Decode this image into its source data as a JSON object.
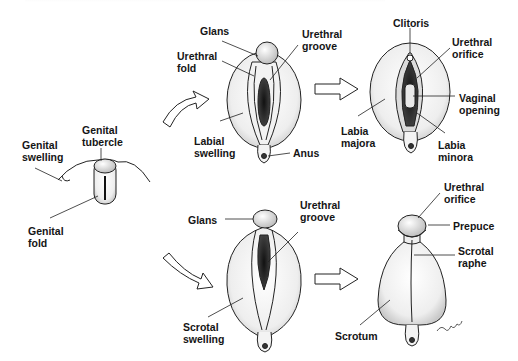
{
  "figure": {
    "stages": {
      "indifferent": {
        "labels": [
          "Genital swelling",
          "Genital tubercle",
          "Genital fold"
        ]
      },
      "female_intermediate": {
        "labels": [
          "Glans",
          "Urethral fold",
          "Urethral groove",
          "Labial swelling",
          "Anus"
        ]
      },
      "female_final": {
        "labels": [
          "Clitoris",
          "Urethral orifice",
          "Vaginal opening",
          "Labia majora",
          "Labia minora"
        ]
      },
      "male_intermediate": {
        "labels": [
          "Glans",
          "Urethral groove",
          "Scrotal swelling"
        ]
      },
      "male_final": {
        "labels": [
          "Urethral orifice",
          "Prepuce",
          "Scrotal raphe",
          "Scrotum"
        ]
      }
    },
    "arrows": [
      "curved-up-right",
      "curved-down-right",
      "straight-right-top",
      "straight-right-bottom"
    ],
    "colors": {
      "ink": "#151515",
      "shade": "#6b6b6b",
      "background": "#ffffff"
    }
  },
  "labels": {
    "genital_swelling": "Genital\nswelling",
    "genital_tubercle": "Genital\ntubercle",
    "genital_fold": "Genital\nfold",
    "f_glans": "Glans",
    "f_urethral_fold": "Urethral\nfold",
    "f_urethral_groove": "Urethral\ngroove",
    "f_labial_swelling": "Labial\nswelling",
    "f_anus": "Anus",
    "clitoris": "Clitoris",
    "f_urethral_orifice": "Urethral\norifice",
    "vaginal_opening": "Vaginal\nopening",
    "labia_majora": "Labia\nmajora",
    "labia_minora": "Labia\nminora",
    "m_glans": "Glans",
    "m_urethral_groove": "Urethral\ngroove",
    "scrotal_swelling": "Scrotal\nswelling",
    "m_urethral_orifice": "Urethral\norifice",
    "prepuce": "Prepuce",
    "scrotal_raphe": "Scrotal\nraphe",
    "scrotum": "Scrotum"
  }
}
